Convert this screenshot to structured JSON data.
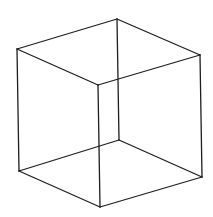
{
  "figure": {
    "stroke_color": "#1e1e1e",
    "background_color": "#ffffff",
    "vertices": {
      "A": [
        17,
        49
      ],
      "B": [
        117,
        19
      ],
      "C": [
        200,
        55
      ],
      "D": [
        98,
        85
      ],
      "E": [
        19,
        171
      ],
      "F": [
        119,
        140
      ],
      "G": [
        202,
        177
      ],
      "H": [
        100,
        207
      ]
    },
    "edges": [
      [
        "A",
        "B"
      ],
      [
        "B",
        "C"
      ],
      [
        "C",
        "D"
      ],
      [
        "D",
        "A"
      ],
      [
        "E",
        "F"
      ],
      [
        "F",
        "G"
      ],
      [
        "G",
        "H"
      ],
      [
        "H",
        "E"
      ],
      [
        "A",
        "E"
      ],
      [
        "B",
        "F"
      ],
      [
        "C",
        "G"
      ],
      [
        "D",
        "H"
      ]
    ]
  }
}
